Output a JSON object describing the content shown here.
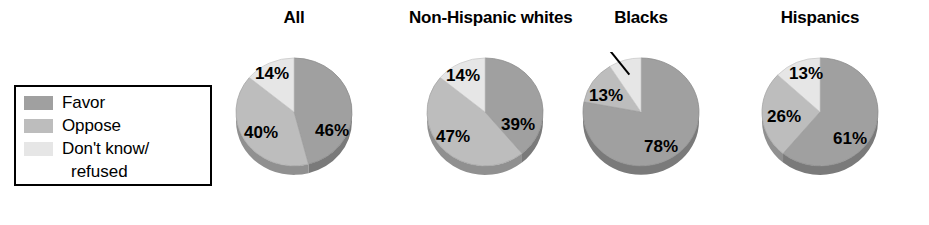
{
  "legend": {
    "items": [
      {
        "label": "Favor",
        "color": "#a0a0a0",
        "key": "favor"
      },
      {
        "label": "Oppose",
        "color": "#bdbdbd",
        "key": "oppose"
      },
      {
        "label": "Don't know/",
        "label_cont": "refused",
        "color": "#e6e6e6",
        "key": "dk"
      }
    ]
  },
  "chart_data": {
    "type": "pie",
    "title": "",
    "legend_position": "left",
    "categories": [
      "Favor",
      "Oppose",
      "Don't know/refused"
    ],
    "colors": [
      "#a0a0a0",
      "#bdbdbd",
      "#e6e6e6"
    ],
    "charts": [
      {
        "title": "All",
        "values": [
          46,
          40,
          14
        ],
        "labels": [
          "46%",
          "40%",
          "14%"
        ]
      },
      {
        "title": "Non-Hispanic whites",
        "values": [
          39,
          47,
          14
        ],
        "labels": [
          "39%",
          "47%",
          "14%"
        ]
      },
      {
        "title": "Blacks",
        "values": [
          78,
          13,
          9
        ],
        "labels": [
          "78%",
          "13%",
          "9%"
        ]
      },
      {
        "title": "Hispanics",
        "values": [
          61,
          26,
          13
        ],
        "labels": [
          "61%",
          "26%",
          "13%"
        ]
      }
    ]
  },
  "pies": [
    {
      "title": "All",
      "slices": [
        {
          "label": "46%",
          "value": 46,
          "color": "#a0a0a0",
          "lx": 38,
          "ly": 20
        },
        {
          "label": "40%",
          "value": 40,
          "color": "#bdbdbd",
          "lx": -33,
          "ly": 22
        },
        {
          "label": "14%",
          "value": 14,
          "color": "#e6e6e6",
          "lx": -22,
          "ly": -37
        }
      ]
    },
    {
      "title": "Non-Hispanic whites",
      "slices": [
        {
          "label": "39%",
          "value": 39,
          "color": "#a0a0a0",
          "lx": 33,
          "ly": 14
        },
        {
          "label": "47%",
          "value": 47,
          "color": "#bdbdbd",
          "lx": -32,
          "ly": 26
        },
        {
          "label": "14%",
          "value": 14,
          "color": "#e6e6e6",
          "lx": -22,
          "ly": -35
        }
      ]
    },
    {
      "title": "Blacks",
      "slices": [
        {
          "label": "78%",
          "value": 78,
          "color": "#a0a0a0",
          "lx": 20,
          "ly": 36
        },
        {
          "label": "13%",
          "value": 13,
          "color": "#bdbdbd",
          "lx": -35,
          "ly": -15
        },
        {
          "label": "9%",
          "value": 9,
          "color": "#e6e6e6",
          "callout": true,
          "lx": -44,
          "ly": -72
        }
      ]
    },
    {
      "title": "Hispanics",
      "slices": [
        {
          "label": "61%",
          "value": 61,
          "color": "#a0a0a0",
          "lx": 30,
          "ly": 28
        },
        {
          "label": "26%",
          "value": 26,
          "color": "#bdbdbd",
          "lx": -36,
          "ly": 6
        },
        {
          "label": "13%",
          "value": 13,
          "color": "#e6e6e6",
          "lx": -14,
          "ly": -37
        }
      ]
    }
  ],
  "layout": {
    "pie_lefts": [
      232,
      409,
      577,
      749
    ],
    "pie_widths": [
      124,
      152,
      128,
      142
    ],
    "pie_radius": 58,
    "pie_depth": 9
  }
}
